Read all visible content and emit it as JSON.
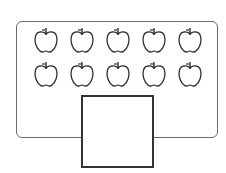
{
  "figure": {
    "rows": 2,
    "columns": 5,
    "apple_count": 10,
    "item_icon": "apple-icon",
    "answer_box": {
      "value": ""
    },
    "stroke_color": "#333333",
    "frame_color": "#6a6a6a"
  }
}
